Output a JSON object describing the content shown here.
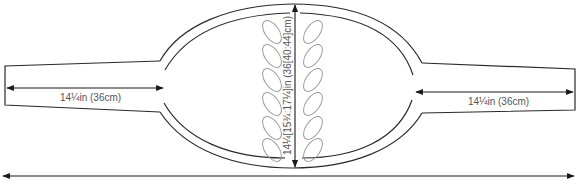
{
  "diagram": {
    "type": "knitting schematic",
    "colors": {
      "line": "#2a2a2a",
      "motif": "#9a9a9a",
      "text": "#555555"
    },
    "labels": {
      "left_sleeve": "14¼in (36cm)",
      "right_sleeve": "14¼in (36cm)",
      "body_height": "14¼[15¾:17¼]in (36[40:44]cm)"
    },
    "motif": {
      "name": "leaf-cable",
      "leaves_per_side": 6
    }
  }
}
